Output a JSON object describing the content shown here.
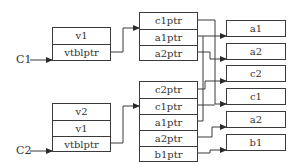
{
  "diagram": {
    "kind": "C++ object layout with vtables (multiple inheritance)",
    "objects": [
      {
        "name": "C1",
        "fields": [
          "v1",
          "vtblptr"
        ],
        "vtable": [
          "c1ptr",
          "a1ptr",
          "a2ptr"
        ]
      },
      {
        "name": "C2",
        "fields": [
          "v2",
          "v1",
          "vtblptr"
        ],
        "vtable": [
          "c2ptr",
          "c1ptr",
          "a1ptr",
          "a2ptr",
          "b1ptr"
        ]
      }
    ],
    "targets": [
      "a1",
      "a2",
      "c2",
      "c1",
      "a2",
      "b1"
    ],
    "edges": [
      {
        "from": "C1.vtblptr",
        "to": "C1.vtable"
      },
      {
        "from": "C1.vtable.c1ptr",
        "to": "c1"
      },
      {
        "from": "C1.vtable.a1ptr",
        "to": "a1"
      },
      {
        "from": "C1.vtable.a2ptr",
        "to": "a2 (upper)"
      },
      {
        "from": "C2.vtblptr",
        "to": "C2.vtable"
      },
      {
        "from": "C2.vtable.c2ptr",
        "to": "c2"
      },
      {
        "from": "C2.vtable.c1ptr",
        "to": "c1"
      },
      {
        "from": "C2.vtable.a1ptr",
        "to": "a1"
      },
      {
        "from": "C2.vtable.a2ptr",
        "to": "a2 (lower)"
      },
      {
        "from": "C2.vtable.b1ptr",
        "to": "b1"
      }
    ],
    "colors": {
      "stroke": "#3a3a3a",
      "text": "#333333",
      "background": "#ffffff"
    }
  }
}
